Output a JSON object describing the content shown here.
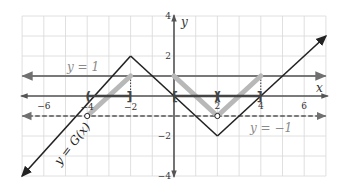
{
  "graph": {
    "axes": {
      "x_label": "x",
      "y_label": "y",
      "x_ticks": [
        {
          "value": -6,
          "label": "−6"
        },
        {
          "value": -4,
          "label": "−4"
        },
        {
          "value": -2,
          "label": "−2"
        },
        {
          "value": 2,
          "label": "2"
        },
        {
          "value": 4,
          "label": "4"
        },
        {
          "value": 6,
          "label": "6"
        }
      ],
      "y_ticks": [
        {
          "value": 4,
          "label": "4"
        },
        {
          "value": 2,
          "label": "2"
        },
        {
          "value": -2,
          "label": "−2"
        },
        {
          "value": -4,
          "label": "−4"
        }
      ],
      "xlim": [
        -7,
        7
      ],
      "ylim": [
        -4,
        4
      ]
    },
    "lines": {
      "upper_label": "y = 1",
      "lower_label": "y = −1",
      "function_label": "y = G(x)"
    },
    "function_points": [
      [
        -7,
        -4
      ],
      [
        -2,
        2
      ],
      [
        2,
        -2
      ],
      [
        7,
        3
      ]
    ],
    "highlight_segments": [
      [
        [
          -4,
          -1
        ],
        [
          -2,
          1
        ]
      ],
      [
        [
          0,
          1
        ],
        [
          2,
          -1
        ]
      ],
      [
        [
          2,
          -1
        ],
        [
          4,
          1
        ]
      ]
    ],
    "open_points": [
      [
        -4,
        -1
      ],
      [
        2,
        -1
      ]
    ],
    "intervals": {
      "left": {
        "open": "(",
        "close": "]",
        "from": -4,
        "to": -2
      },
      "right_a": {
        "open": "[",
        "close": ")",
        "from": 0,
        "to": 2
      },
      "right_b": {
        "open": "(",
        "close": "]",
        "from": 2,
        "to": 4
      }
    },
    "colors": {
      "grid": "#d8d8d8",
      "axis": "#555555",
      "function": "#222222",
      "highlight": "#b8b8b8",
      "reference_line": "#707070",
      "interval": "#444444"
    }
  },
  "chart_data": {
    "type": "line",
    "title": "",
    "xlabel": "x",
    "ylabel": "y",
    "xlim": [
      -7,
      7
    ],
    "ylim": [
      -4,
      4
    ],
    "grid": true,
    "series": [
      {
        "name": "y = G(x)",
        "x": [
          -7,
          -2,
          2,
          7
        ],
        "y": [
          -4,
          2,
          -2,
          3
        ]
      },
      {
        "name": "y = 1",
        "x": [
          -7,
          7
        ],
        "y": [
          1,
          1
        ]
      },
      {
        "name": "y = −1 (dashed)",
        "x": [
          -7,
          7
        ],
        "y": [
          -1,
          -1
        ]
      }
    ],
    "annotations": [
      "interval (−4, −2] on x-axis",
      "interval [0, 2) on x-axis",
      "interval (2, 4] on x-axis",
      "open circles at (−4, −1) and (2, −1)",
      "shaded segments where −1 < G(x) ≤ 1"
    ]
  }
}
